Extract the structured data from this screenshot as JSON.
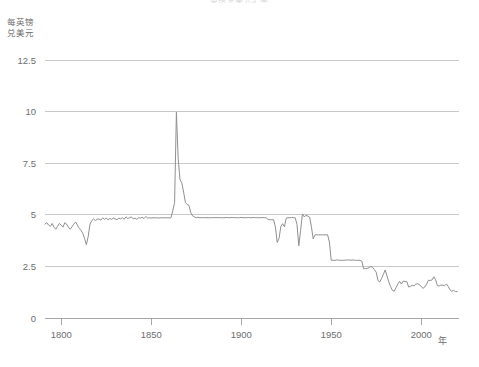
{
  "chart_data": {
    "type": "line",
    "title": "英镑兑美元汇率",
    "ylabel": "每英镑\n兑美元",
    "ylabel_line1": "每英镑",
    "ylabel_line2": "兑美元",
    "xlabel": "年",
    "grid": "horizontal",
    "legend": "none",
    "xlim": [
      1791,
      2021
    ],
    "ylim": [
      0,
      13.2
    ],
    "yticks": [
      0,
      2.5,
      5,
      7.5,
      10,
      12.5
    ],
    "ytick_labels": [
      "0",
      "2.5",
      "5",
      "7.5",
      "10",
      "12.5"
    ],
    "xticks": [
      1800,
      1850,
      1900,
      1950,
      2000
    ],
    "xtick_labels": [
      "1800",
      "1850",
      "1900",
      "1950",
      "2000"
    ],
    "series": [
      {
        "name": "GBP/USD",
        "x": [
          1791,
          1792,
          1793,
          1794,
          1795,
          1796,
          1797,
          1798,
          1799,
          1800,
          1801,
          1802,
          1803,
          1804,
          1805,
          1806,
          1807,
          1808,
          1809,
          1810,
          1811,
          1812,
          1813,
          1814,
          1815,
          1816,
          1817,
          1818,
          1819,
          1820,
          1821,
          1822,
          1823,
          1824,
          1825,
          1826,
          1827,
          1828,
          1829,
          1830,
          1831,
          1832,
          1833,
          1834,
          1835,
          1836,
          1837,
          1838,
          1839,
          1840,
          1841,
          1842,
          1843,
          1844,
          1845,
          1846,
          1847,
          1848,
          1849,
          1850,
          1851,
          1852,
          1853,
          1854,
          1855,
          1856,
          1857,
          1858,
          1859,
          1860,
          1861,
          1862,
          1863,
          1864,
          1865,
          1866,
          1867,
          1868,
          1869,
          1870,
          1871,
          1872,
          1873,
          1874,
          1875,
          1876,
          1877,
          1878,
          1879,
          1880,
          1881,
          1882,
          1883,
          1884,
          1885,
          1886,
          1887,
          1888,
          1889,
          1890,
          1891,
          1892,
          1893,
          1894,
          1895,
          1896,
          1897,
          1898,
          1899,
          1900,
          1901,
          1902,
          1903,
          1904,
          1905,
          1906,
          1907,
          1908,
          1909,
          1910,
          1911,
          1912,
          1913,
          1914,
          1915,
          1916,
          1917,
          1918,
          1919,
          1920,
          1921,
          1922,
          1923,
          1924,
          1925,
          1926,
          1927,
          1928,
          1929,
          1930,
          1931,
          1932,
          1933,
          1934,
          1935,
          1936,
          1937,
          1938,
          1939,
          1940,
          1941,
          1942,
          1943,
          1944,
          1945,
          1946,
          1947,
          1948,
          1949,
          1950,
          1951,
          1952,
          1953,
          1954,
          1955,
          1956,
          1957,
          1958,
          1959,
          1960,
          1961,
          1962,
          1963,
          1964,
          1965,
          1966,
          1967,
          1968,
          1969,
          1970,
          1971,
          1972,
          1973,
          1974,
          1975,
          1976,
          1977,
          1978,
          1979,
          1980,
          1981,
          1982,
          1983,
          1984,
          1985,
          1986,
          1987,
          1988,
          1989,
          1990,
          1991,
          1992,
          1993,
          1994,
          1995,
          1996,
          1997,
          1998,
          1999,
          2000,
          2001,
          2002,
          2003,
          2004,
          2005,
          2006,
          2007,
          2008,
          2009,
          2010,
          2011,
          2012,
          2013,
          2014,
          2015,
          2016,
          2017,
          2018,
          2019,
          2020
        ],
        "values": [
          4.55,
          4.62,
          4.5,
          4.44,
          4.58,
          4.4,
          4.3,
          4.45,
          4.58,
          4.5,
          4.4,
          4.62,
          4.55,
          4.4,
          4.3,
          4.42,
          4.55,
          4.65,
          4.5,
          4.35,
          4.25,
          4.1,
          3.85,
          3.55,
          3.95,
          4.55,
          4.72,
          4.8,
          4.72,
          4.78,
          4.8,
          4.74,
          4.85,
          4.78,
          4.84,
          4.76,
          4.82,
          4.78,
          4.84,
          4.8,
          4.76,
          4.84,
          4.8,
          4.86,
          4.78,
          4.9,
          4.82,
          4.86,
          4.9,
          4.8,
          4.84,
          4.78,
          4.86,
          4.84,
          4.88,
          4.82,
          4.92,
          4.84,
          4.86,
          4.84,
          4.86,
          4.85,
          4.86,
          4.84,
          4.86,
          4.85,
          4.86,
          4.85,
          4.86,
          4.85,
          4.86,
          5.2,
          5.6,
          9.97,
          7.7,
          6.7,
          6.55,
          6.1,
          5.6,
          5.5,
          5.45,
          5.1,
          4.95,
          4.9,
          4.86,
          4.88,
          4.86,
          4.86,
          4.86,
          4.86,
          4.86,
          4.86,
          4.86,
          4.86,
          4.86,
          4.87,
          4.86,
          4.86,
          4.86,
          4.86,
          4.86,
          4.87,
          4.86,
          4.86,
          4.87,
          4.86,
          4.86,
          4.86,
          4.86,
          4.87,
          4.86,
          4.86,
          4.86,
          4.87,
          4.86,
          4.86,
          4.87,
          4.86,
          4.86,
          4.86,
          4.86,
          4.87,
          4.86,
          4.86,
          4.76,
          4.76,
          4.76,
          4.76,
          4.42,
          3.66,
          3.85,
          4.43,
          4.57,
          4.42,
          4.83,
          4.86,
          4.86,
          4.87,
          4.86,
          4.86,
          4.53,
          3.5,
          4.24,
          5.04,
          4.9,
          4.97,
          4.94,
          4.89,
          4.43,
          3.83,
          4.03,
          4.03,
          4.03,
          4.03,
          4.03,
          4.03,
          4.03,
          4.03,
          3.68,
          2.8,
          2.8,
          2.79,
          2.81,
          2.81,
          2.79,
          2.8,
          2.79,
          2.81,
          2.81,
          2.81,
          2.8,
          2.81,
          2.8,
          2.79,
          2.8,
          2.79,
          2.75,
          2.39,
          2.39,
          2.4,
          2.44,
          2.5,
          2.45,
          2.34,
          2.22,
          1.81,
          1.75,
          1.92,
          2.12,
          2.33,
          2.03,
          1.75,
          1.52,
          1.34,
          1.3,
          1.47,
          1.64,
          1.78,
          1.64,
          1.79,
          1.77,
          1.77,
          1.5,
          1.53,
          1.58,
          1.56,
          1.64,
          1.66,
          1.62,
          1.52,
          1.44,
          1.5,
          1.64,
          1.83,
          1.82,
          1.84,
          2.0,
          1.85,
          1.57,
          1.55,
          1.6,
          1.59,
          1.56,
          1.65,
          1.53,
          1.36,
          1.29,
          1.34,
          1.28,
          1.28
        ]
      }
    ]
  },
  "axis": {
    "y_caption_line1": "每英镑",
    "y_caption_line2": "兑美元",
    "x_caption": "年"
  },
  "colors": {
    "series": "#8d8f91",
    "gridline": "#b9bbbd",
    "axis": "#9a9c9e",
    "text": "#6d6e71",
    "background": "#ffffff"
  }
}
